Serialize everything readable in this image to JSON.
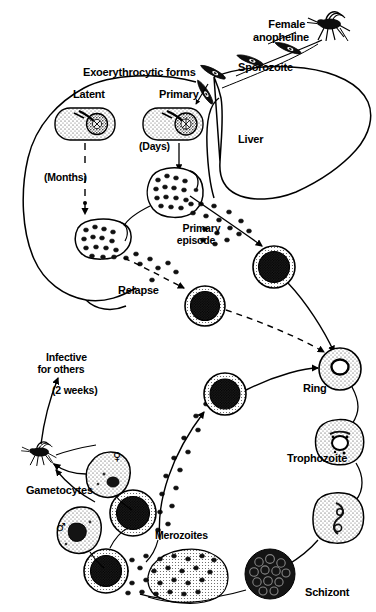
{
  "figure": {
    "ink_color": "#000000",
    "background_color": "#ffffff"
  },
  "labels": {
    "female_anopheline": "Female\nanopheline",
    "sporozoite": "Sporozoite",
    "exoerythrocytic_forms": "Exoerythrocytic forms",
    "latent": "Latent",
    "primary": "Primary",
    "days": "(Days)",
    "months": "(Months)",
    "liver": "Liver",
    "primary_episode": "Primary\nepisode",
    "relapse": "Relapse",
    "infective_for_others": "Infective\nfor others",
    "two_weeks": "(2 weeks)",
    "gametocytes": "Gametocytes",
    "merozoites": "Merozoites",
    "ring": "Ring",
    "trophozoite": "Trophozoite",
    "schizont": "Schizont",
    "female_symbol": "♀",
    "male_symbol": "♂"
  },
  "stages": [
    {
      "name": "sporozoite",
      "label": "Sporozoite",
      "compartment": "vector"
    },
    {
      "name": "latent-exoerythrocytic-form",
      "label": "Latent",
      "compartment": "liver"
    },
    {
      "name": "primary-exoerythrocytic-form",
      "label": "Primary",
      "compartment": "liver"
    },
    {
      "name": "primary-episode",
      "label": "Primary episode",
      "compartment": "liver"
    },
    {
      "name": "relapse",
      "label": "Relapse",
      "compartment": "liver"
    },
    {
      "name": "ring",
      "label": "Ring",
      "compartment": "blood"
    },
    {
      "name": "trophozoite",
      "label": "Trophozoite",
      "compartment": "blood"
    },
    {
      "name": "schizont",
      "label": "Schizont",
      "compartment": "blood"
    },
    {
      "name": "merozoites",
      "label": "Merozoites",
      "compartment": "blood"
    },
    {
      "name": "gametocytes",
      "label": "Gametocytes",
      "compartment": "blood"
    }
  ],
  "timings": [
    {
      "name": "primary-delay",
      "label": "(Days)"
    },
    {
      "name": "latent-delay",
      "label": "(Months)"
    },
    {
      "name": "gametocyte-infectivity-delay",
      "label": "(2 weeks)"
    }
  ]
}
